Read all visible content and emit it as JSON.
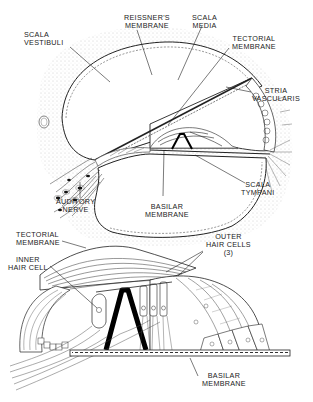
{
  "diagram": {
    "type": "anatomical-illustration",
    "colors": {
      "ink": "#1a1a1a",
      "background": "#ffffff",
      "stipple": "#9a9a9a"
    },
    "top_panel": {
      "labels": {
        "scala_vestibuli": "SCALA\nVESTIBULI",
        "reissners_membrane": "REISSNER'S\nMEMBRANE",
        "scala_media": "SCALA\nMEDIA",
        "tectorial_membrane": "TECTORIAL\nMEMBRANE",
        "stria_vascularis": "STRIA\nVASCULARIS",
        "auditory_nerve": "AUDITORY\nNERVE",
        "basilar_membrane": "BASILAR\nMEMBRANE",
        "scala_tympani": "SCALA\nTYMPANI"
      }
    },
    "bottom_panel": {
      "labels": {
        "tectorial_membrane": "TECTORIAL\nMEMBRANE",
        "inner_hair_cell": "INNER\nHAIR CELL",
        "outer_hair_cells": "OUTER\nHAIR CELLS\n(3)",
        "basilar_membrane": "BASILAR\nMEMBRANE"
      }
    }
  }
}
